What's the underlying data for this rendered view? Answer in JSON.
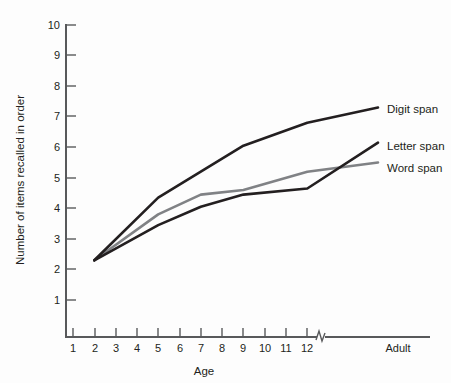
{
  "chart_data": {
    "type": "line",
    "title": "",
    "xlabel": "Age",
    "ylabel": "Number of items recalled in order",
    "ylim": [
      0,
      10
    ],
    "grid": false,
    "legend_position": "right-inline",
    "x_tick_labels": [
      "1",
      "2",
      "3",
      "4",
      "5",
      "6",
      "7",
      "8",
      "9",
      "10",
      "11",
      "12",
      "Adult"
    ],
    "y_tick_labels": [
      "1",
      "2",
      "3",
      "4",
      "5",
      "6",
      "7",
      "8",
      "9",
      "10"
    ],
    "x_axis_break": true,
    "x_axis_break_note": "axis break between age 12 and Adult",
    "x": [
      2,
      5,
      7,
      9,
      12,
      "Adult"
    ],
    "series": [
      {
        "name": "Digit span",
        "color": "#231f20",
        "values": [
          2.3,
          4.35,
          5.2,
          6.05,
          6.8,
          7.3
        ]
      },
      {
        "name": "Letter span",
        "color": "#231f20",
        "values": [
          2.3,
          3.45,
          4.05,
          4.45,
          4.65,
          6.15
        ]
      },
      {
        "name": "Word span",
        "color": "#808285",
        "values": [
          2.3,
          3.8,
          4.45,
          4.6,
          5.2,
          5.5
        ]
      }
    ]
  },
  "axes": {
    "y_title": "Number of items recalled in order",
    "x_title": "Age",
    "y_ticks": [
      "10",
      "9",
      "8",
      "7",
      "6",
      "5",
      "4",
      "3",
      "2",
      "1"
    ],
    "x_ticks": [
      "1",
      "2",
      "3",
      "4",
      "5",
      "6",
      "7",
      "8",
      "9",
      "10",
      "11",
      "12"
    ],
    "x_last_label": "Adult"
  },
  "legend": {
    "items": [
      {
        "label": "Digit span"
      },
      {
        "label": "Letter span"
      },
      {
        "label": "Word span"
      }
    ]
  }
}
